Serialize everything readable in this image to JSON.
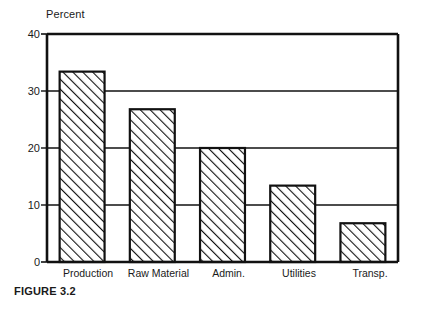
{
  "figure": {
    "caption": "FIGURE 3.2"
  },
  "chart_data": {
    "type": "bar",
    "title": "",
    "subtitle": "",
    "xlabel": "",
    "ylabel": "Percent",
    "ylim": [
      0,
      40
    ],
    "yticks": [
      0,
      10,
      20,
      30,
      40
    ],
    "ytick_labels": [
      "0",
      "10",
      "20",
      "30",
      "40"
    ],
    "grid": "horizontal",
    "legend": "none",
    "categories": [
      "Production",
      "Raw Material",
      "Admin.",
      "Utilities",
      "Transp."
    ],
    "values": [
      33.4,
      26.8,
      20.0,
      13.4,
      6.8
    ],
    "bar_style": {
      "fill": "hatch-diagonal-45",
      "edge_color": "#000000",
      "face_color": "#ffffff"
    },
    "axis_color": "#000000",
    "background": "#ffffff"
  }
}
